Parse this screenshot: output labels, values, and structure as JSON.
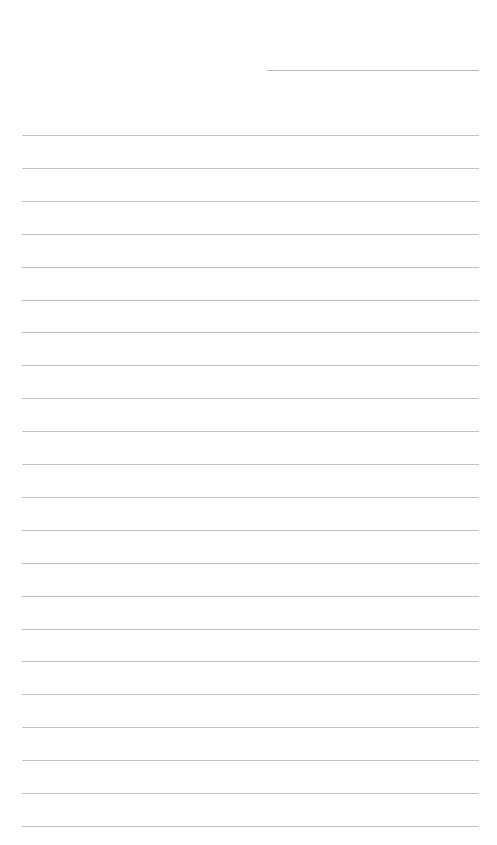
{
  "page": {
    "type": "ruled-paper",
    "background_color": "#ffffff",
    "line_color": "#c2c2c2",
    "header_line": {
      "x1": 267,
      "x2": 479,
      "y": 70,
      "color": "#b9b9b9"
    },
    "ruled_lines": {
      "x1": 22,
      "x2": 479,
      "first_y": 135,
      "spacing": 32.9,
      "count": 22
    }
  }
}
